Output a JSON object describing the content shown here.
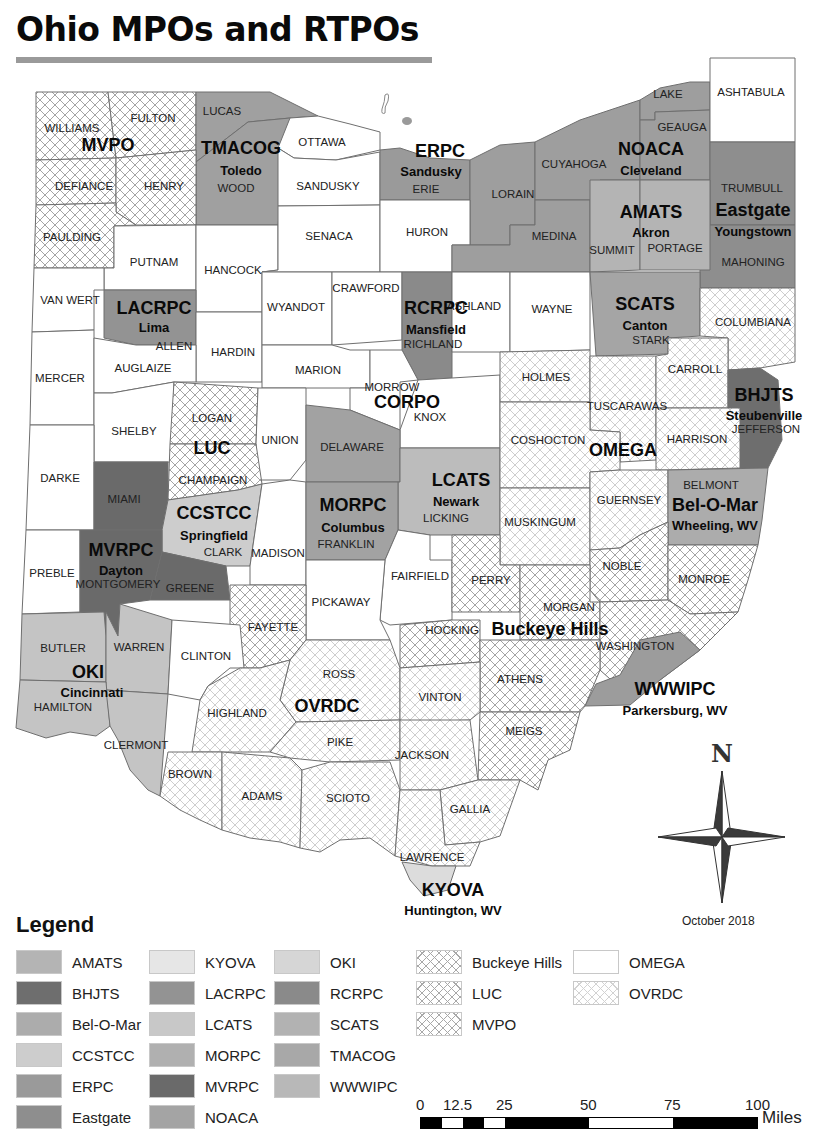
{
  "title": "Ohio MPOs and RTPOs",
  "date": "October 2018",
  "north_arrow": {
    "label": "N"
  },
  "colors": {
    "AMATS": "#b4b4b4",
    "BHJTS": "#6e6e6e",
    "Bel-O-Mar": "#acacac",
    "CCSTCC": "#cdcdcd",
    "ERPC": "#9a9a9a",
    "Eastgate": "#8e8e8e",
    "KYOVA": "#dcdcdc",
    "LACRPC": "#939393",
    "LCATS": "#bcbcbc",
    "MORPC": "#a2a2a2",
    "MVRPC": "#6a6a6a",
    "NOACA": "#9e9e9e",
    "OKI": "#c4c4c4",
    "RCRPC": "#8a8a8a",
    "SCATS": "#a5a5a5",
    "TMACOG": "#a0a0a0",
    "WWWIPC": "#9c9c9c",
    "none": "#ffffff"
  },
  "organizations": [
    {
      "name": "MVPO",
      "city": ""
    },
    {
      "name": "TMACOG",
      "city": "Toledo"
    },
    {
      "name": "ERPC",
      "city": "Sandusky"
    },
    {
      "name": "NOACA",
      "city": "Cleveland"
    },
    {
      "name": "AMATS",
      "city": "Akron"
    },
    {
      "name": "Eastgate",
      "city": "Youngstown"
    },
    {
      "name": "LACRPC",
      "city": "Lima"
    },
    {
      "name": "RCRPC",
      "city": "Mansfield"
    },
    {
      "name": "SCATS",
      "city": "Canton"
    },
    {
      "name": "CORPO",
      "city": ""
    },
    {
      "name": "BHJTS",
      "city": "Steubenville"
    },
    {
      "name": "LUC",
      "city": ""
    },
    {
      "name": "OMEGA",
      "city": ""
    },
    {
      "name": "LCATS",
      "city": "Newark"
    },
    {
      "name": "CCSTCC",
      "city": "Springfield"
    },
    {
      "name": "MORPC",
      "city": "Columbus"
    },
    {
      "name": "Bel-O-Mar",
      "city": "Wheeling, WV"
    },
    {
      "name": "MVRPC",
      "city": "Dayton"
    },
    {
      "name": "Buckeye Hills",
      "city": ""
    },
    {
      "name": "OKI",
      "city": "Cincinnati"
    },
    {
      "name": "OVRDC",
      "city": ""
    },
    {
      "name": "WWWIPC",
      "city": "Parkersburg, WV"
    },
    {
      "name": "KYOVA",
      "city": "Huntington, WV"
    }
  ],
  "counties": [
    "WILLIAMS",
    "FULTON",
    "LUCAS",
    "OTTAWA",
    "DEFIANCE",
    "HENRY",
    "WOOD",
    "SANDUSKY",
    "ERIE",
    "LORAIN",
    "CUYAHOGA",
    "LAKE",
    "GEAUGA",
    "ASHTABULA",
    "PAULDING",
    "PUTNAM",
    "HANCOCK",
    "SENACA",
    "HURON",
    "MEDINA",
    "SUMMIT",
    "PORTAGE",
    "TRUMBULL",
    "MAHONING",
    "VAN WERT",
    "ALLEN",
    "HARDIN",
    "WYANDOT",
    "CRAWFORD",
    "RICHLAND",
    "ASHLAND",
    "WAYNE",
    "STARK",
    "COLUMBIANA",
    "MERCER",
    "AUGLAIZE",
    "MARION",
    "MORROW",
    "KNOX",
    "HOLMES",
    "TUSCARAWAS",
    "CARROLL",
    "JEFFERSON",
    "SHELBY",
    "LOGAN",
    "UNION",
    "DELAWARE",
    "LICKING",
    "COSHOCTON",
    "HARRISON",
    "DARKE",
    "MIAMI",
    "CHAMPAIGN",
    "CLARK",
    "MADISON",
    "FRANKLIN",
    "MUSKINGUM",
    "GUERNSEY",
    "BELMONT",
    "PREBLE",
    "MONTGOMERY",
    "GREENE",
    "FAIRFIELD",
    "PERRY",
    "NOBLE",
    "MONROE",
    "PICKAWAY",
    "FAYETTE",
    "MORGAN",
    "HOCKING",
    "WASHINGTON",
    "BUTLER",
    "WARREN",
    "CLINTON",
    "ROSS",
    "ATHENS",
    "HAMILTON",
    "HIGHLAND",
    "VINTON",
    "MEIGS",
    "CLERMONT",
    "PIKE",
    "JACKSON",
    "BROWN",
    "ADAMS",
    "SCIOTO",
    "GALLIA",
    "LAWRENCE"
  ],
  "legend": {
    "title": "Legend",
    "solid_items": [
      {
        "label": "AMATS",
        "key": "AMATS"
      },
      {
        "label": "BHJTS",
        "key": "BHJTS"
      },
      {
        "label": "Bel-O-Mar",
        "key": "Bel-O-Mar"
      },
      {
        "label": "CCSTCC",
        "key": "CCSTCC"
      },
      {
        "label": "ERPC",
        "key": "ERPC"
      },
      {
        "label": "Eastgate",
        "key": "Eastgate"
      },
      {
        "label": "KYOVA",
        "key": "KYOVA"
      },
      {
        "label": "LACRPC",
        "key": "LACRPC"
      },
      {
        "label": "LCATS",
        "key": "LCATS"
      },
      {
        "label": "MORPC",
        "key": "MORPC"
      },
      {
        "label": "MVRPC",
        "key": "MVRPC"
      },
      {
        "label": "NOACA",
        "key": "NOACA"
      },
      {
        "label": "OKI",
        "key": "OKI"
      },
      {
        "label": "RCRPC",
        "key": "RCRPC"
      },
      {
        "label": "SCATS",
        "key": "SCATS"
      },
      {
        "label": "TMACOG",
        "key": "TMACOG"
      },
      {
        "label": "WWWIPC",
        "key": "WWWIPC"
      }
    ],
    "pattern_items": [
      {
        "label": "Buckeye Hills",
        "pattern": "crosshatch"
      },
      {
        "label": "LUC",
        "pattern": "crosshatch"
      },
      {
        "label": "MVPO",
        "pattern": "crosshatch"
      },
      {
        "label": "OMEGA",
        "pattern": "none"
      },
      {
        "label": "OVRDC",
        "pattern": "crosshatch-light"
      }
    ]
  },
  "scale_bar": {
    "ticks": [
      "0",
      "12.5",
      "25",
      "50",
      "75",
      "100"
    ],
    "unit": "Miles"
  }
}
